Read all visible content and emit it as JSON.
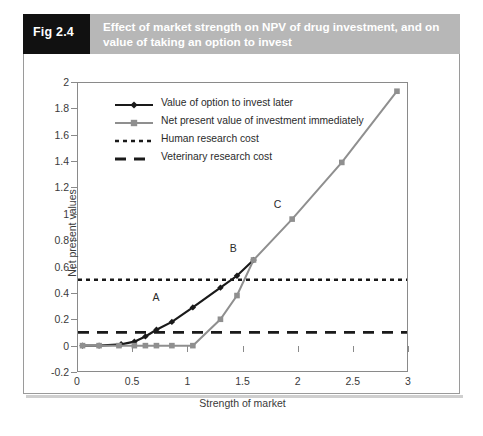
{
  "header": {
    "fig_number": "Fig 2.4",
    "title": "Effect of market strength on NPV of drug investment, and on value of taking an option to invest"
  },
  "chart_data": {
    "type": "line",
    "title": "Effect of market strength on NPV of drug investment, and on value of taking an option to invest",
    "xlabel": "Strength of market",
    "ylabel": "Net present values",
    "xlim": [
      0,
      3
    ],
    "ylim": [
      -0.2,
      2
    ],
    "xticks": [
      "0",
      "0.5",
      "1",
      "1.5",
      "2",
      "2.5",
      "3"
    ],
    "xtick_values": [
      0,
      0.5,
      1,
      1.5,
      2,
      2.5,
      3
    ],
    "yticks": [
      "-0.2",
      "0",
      "0.2",
      "0.4",
      "0.6",
      "0.8",
      "1",
      "1.2",
      "1.4",
      "1.6",
      "1.8",
      "2"
    ],
    "ytick_values": [
      -0.2,
      0,
      0.2,
      0.4,
      0.6,
      0.8,
      1,
      1.2,
      1.4,
      1.6,
      1.8,
      2
    ],
    "grid": false,
    "legend_position": "upper-left-inside",
    "series": [
      {
        "name": "Value of option to invest later",
        "color": "#1a1a1a",
        "marker": "diamond",
        "style": "solid",
        "x": [
          0.05,
          0.2,
          0.4,
          0.52,
          0.62,
          0.72,
          0.86,
          1.05,
          1.3,
          1.45,
          1.6
        ],
        "y": [
          0.0,
          0.0,
          0.01,
          0.03,
          0.07,
          0.12,
          0.18,
          0.29,
          0.44,
          0.53,
          0.65
        ]
      },
      {
        "name": "Net present value of investment immediately",
        "color": "#8f8f8f",
        "marker": "square",
        "style": "solid",
        "x": [
          0.05,
          0.2,
          0.38,
          0.52,
          0.62,
          0.72,
          0.86,
          1.05,
          1.3,
          1.45,
          1.6,
          1.95,
          2.4,
          2.9
        ],
        "y": [
          0.0,
          0.0,
          0.0,
          0.0,
          0.0,
          0.0,
          0.0,
          0.0,
          0.2,
          0.38,
          0.65,
          0.96,
          1.39,
          1.93
        ]
      },
      {
        "name": "Human research cost",
        "color": "#1a1a1a",
        "marker": "none",
        "style": "dotted",
        "constant_y": 0.5
      },
      {
        "name": "Veterinary research cost",
        "color": "#1a1a1a",
        "marker": "none",
        "style": "dashed",
        "constant_y": 0.1
      }
    ],
    "annotations": [
      {
        "label": "A",
        "x": 0.72,
        "y": 0.36
      },
      {
        "label": "B",
        "x": 1.42,
        "y": 0.73
      },
      {
        "label": "C",
        "x": 1.82,
        "y": 1.07
      }
    ]
  }
}
